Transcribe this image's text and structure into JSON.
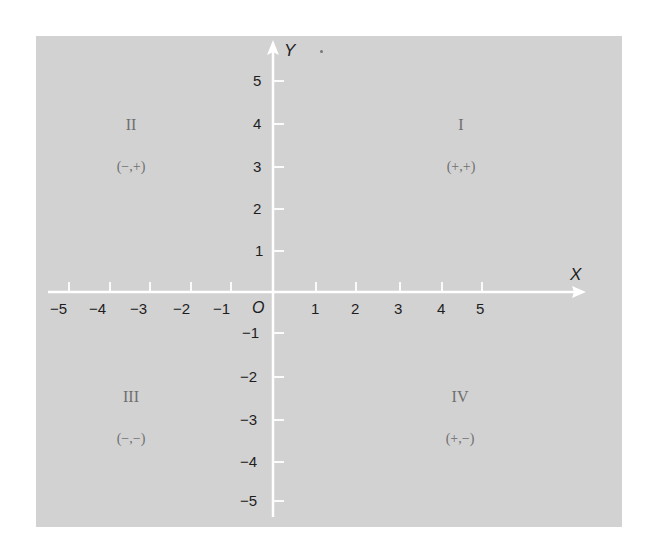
{
  "diagram": {
    "colors": {
      "background": "#d2d2d2",
      "axes": "#ffffff",
      "text": "#1e1e1e",
      "quadrant_text": "#6f6f6f"
    },
    "axes": {
      "x_label": "X",
      "y_label": "Y",
      "origin_label": "O",
      "x_ticks": [
        "−5",
        "−4",
        "−3",
        "−2",
        "−1",
        "1",
        "2",
        "3",
        "4",
        "5"
      ],
      "y_ticks_positive": [
        "5",
        "4",
        "3",
        "2",
        "1"
      ],
      "y_ticks_negative": [
        "−1",
        "−2",
        "−3",
        "−4",
        "−5"
      ]
    },
    "quadrants": [
      {
        "numeral": "I",
        "signs": "(+,+)"
      },
      {
        "numeral": "II",
        "signs": "(−,+)"
      },
      {
        "numeral": "III",
        "signs": "(−,−)"
      },
      {
        "numeral": "IV",
        "signs": "(+,−)"
      }
    ]
  }
}
